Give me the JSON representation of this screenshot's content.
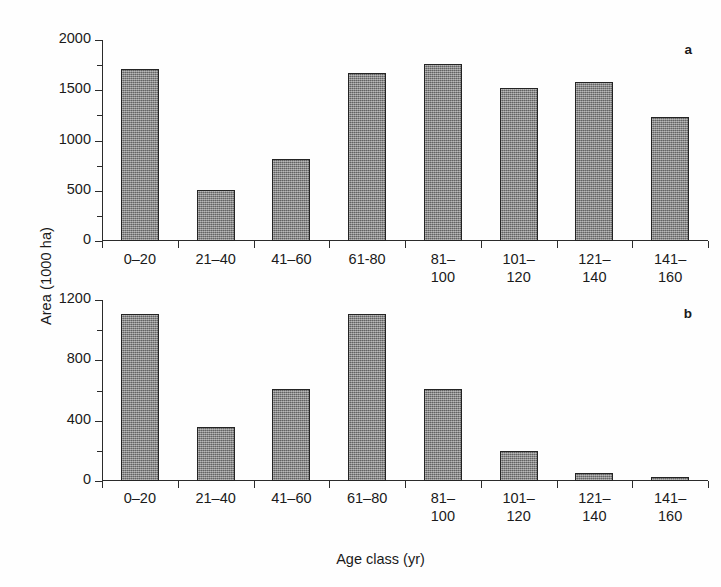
{
  "figure": {
    "y_axis_title": "Area (1000 ha)",
    "x_axis_title": "Age class (yr)"
  },
  "chart_data": [
    {
      "type": "bar",
      "panel_label": "a",
      "title": "",
      "xlabel": "Age class (yr)",
      "ylabel": "Area (1000 ha)",
      "categories": [
        "0–20",
        "21–40",
        "41–60",
        "61-80",
        "81–\n100",
        "101–\n120",
        "121–\n140",
        "141–\n160"
      ],
      "values": [
        1710,
        505,
        815,
        1670,
        1765,
        1520,
        1580,
        1230
      ],
      "ylim": [
        0,
        2000
      ],
      "yticks": [
        0,
        500,
        1000,
        1500,
        2000
      ],
      "ytick_labels": [
        "0",
        "500",
        "1000",
        "1500",
        "2000"
      ],
      "yminor_ticks": [
        250,
        750,
        1250,
        1750
      ],
      "grid": false,
      "legend": "none",
      "bar_fill": "#7d7d7d",
      "bar_edge": "#242424"
    },
    {
      "type": "bar",
      "panel_label": "b",
      "title": "",
      "xlabel": "Age class (yr)",
      "ylabel": "Area (1000 ha)",
      "categories": [
        "0–20",
        "21–40",
        "41–60",
        "61–80",
        "81–\n100",
        "101–\n120",
        "121–\n140",
        "141–\n160"
      ],
      "values": [
        1110,
        355,
        610,
        1110,
        610,
        200,
        50,
        25
      ],
      "ylim": [
        0,
        1200
      ],
      "yticks": [
        0,
        400,
        800,
        1200
      ],
      "ytick_labels": [
        "0",
        "400",
        "800",
        "1200"
      ],
      "yminor_ticks": [
        200,
        600,
        1000
      ],
      "grid": false,
      "legend": "none",
      "bar_fill": "#7d7d7d",
      "bar_edge": "#242424"
    }
  ]
}
